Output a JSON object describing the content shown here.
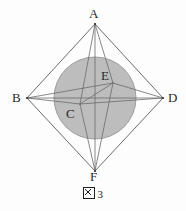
{
  "figure": {
    "caption_symbol": "図",
    "caption_number": "3",
    "caption_full": "図 3"
  },
  "diagram": {
    "type": "geometry-octahedron-with-inscribed-sphere",
    "background_color": "#fdfdfd",
    "stroke_color": "#4a4a4a",
    "sphere_fill_color": "#bdbdbd",
    "sphere_stroke_color": "#9a9a9a",
    "label_color": "#2a2a2a",
    "vertices": [
      {
        "id": "A",
        "label": "A",
        "x": 95,
        "y": 24
      },
      {
        "id": "B",
        "label": "B",
        "x": 27,
        "y": 98
      },
      {
        "id": "C",
        "label": "C",
        "x": 80,
        "y": 104
      },
      {
        "id": "D",
        "label": "D",
        "x": 163,
        "y": 98
      },
      {
        "id": "E",
        "label": "E",
        "x": 113,
        "y": 83
      },
      {
        "id": "F",
        "label": "F",
        "x": 95,
        "y": 171
      }
    ],
    "sphere": {
      "cx": 95,
      "cy": 98,
      "r": 41
    },
    "outer_edges": [
      "A-B",
      "A-D",
      "B-F",
      "D-F"
    ],
    "inner_edges": [
      "A-C",
      "A-E",
      "C-F",
      "E-F",
      "B-C",
      "B-E",
      "D-C",
      "D-E",
      "C-E",
      "B-D",
      "A-F"
    ]
  }
}
